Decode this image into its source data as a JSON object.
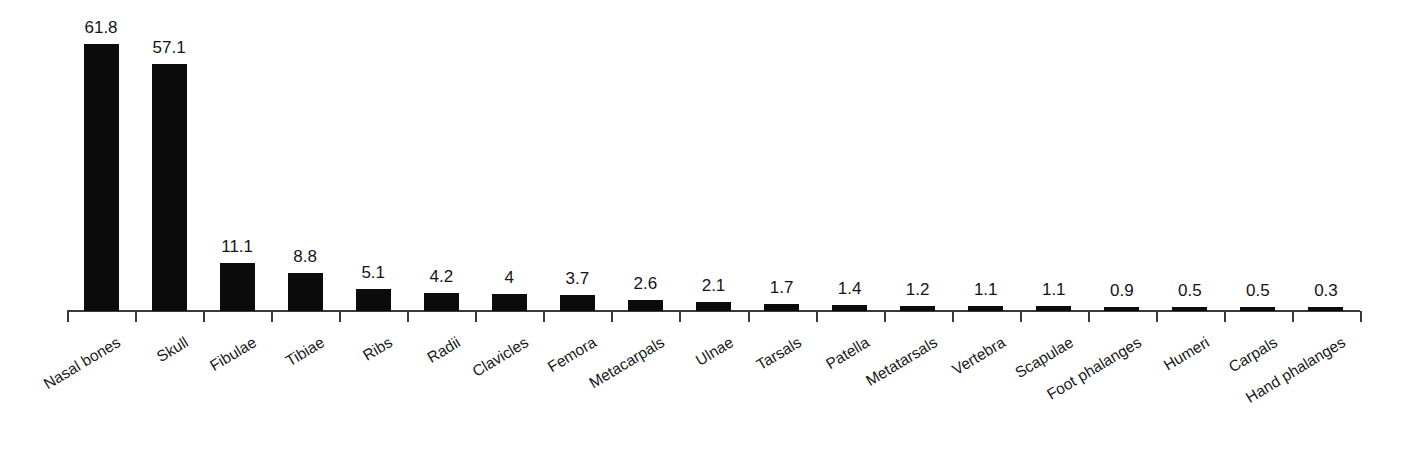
{
  "chart_data": {
    "type": "bar",
    "title": "",
    "subtitle": "",
    "xlabel": "",
    "ylabel": "",
    "ylim": [
      0,
      61.8
    ],
    "grid": false,
    "legend": false,
    "orientation": "vertical",
    "bar_color": "#0b0b0b",
    "axis_color": "#3a3a3a",
    "background_color": "#ffffff",
    "value_labels_shown": true,
    "categories": [
      "Nasal bones",
      "Skull",
      "Fibulae",
      "Tibiae",
      "Ribs",
      "Radii",
      "Clavicles",
      "Femora",
      "Metacarpals",
      "Ulnae",
      "Tarsals",
      "Patella",
      "Metatarsals",
      "Vertebra",
      "Scapulae",
      "Foot phalanges",
      "Humeri",
      "Carpals",
      "Hand phalanges"
    ],
    "values": [
      61.8,
      57.1,
      11.1,
      8.8,
      5.1,
      4.2,
      4,
      3.7,
      2.6,
      2.1,
      1.7,
      1.4,
      1.2,
      1.1,
      1.1,
      0.9,
      0.5,
      0.5,
      0.3
    ],
    "value_labels": [
      "61.8",
      "57.1",
      "11.1",
      "8.8",
      "5.1",
      "4.2",
      "4",
      "3.7",
      "2.6",
      "2.1",
      "1.7",
      "1.4",
      "1.2",
      "1.1",
      "1.1",
      "0.9",
      "0.5",
      "0.5",
      "0.3"
    ]
  }
}
